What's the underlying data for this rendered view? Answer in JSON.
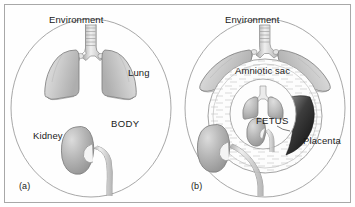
{
  "figure": {
    "type": "anatomical-diagram",
    "panels": [
      {
        "id": "a",
        "caption": "(a)",
        "labels": {
          "environment": "Environment",
          "lung": "Lung",
          "body": "BODY",
          "kidney": "Kidney"
        },
        "organs": [
          "trachea",
          "lungs",
          "kidney",
          "ureter"
        ],
        "description": "Adult body circle with lungs open to environment and kidney"
      },
      {
        "id": "b",
        "caption": "(b)",
        "labels": {
          "environment": "Environment",
          "amniotic_sac": "Amniotic sac",
          "fetus": "FETUS",
          "placenta": "Placenta"
        },
        "organs": [
          "maternal-trachea",
          "maternal-lungs",
          "maternal-kidney",
          "maternal-ureter",
          "amniotic-fluid",
          "fetal-lungs",
          "fetal-kidney",
          "placenta",
          "umbilical-cord"
        ],
        "description": "Pregnant body circle containing amniotic sac and fetus with placenta"
      }
    ]
  },
  "colors": {
    "frame_border": "#a8a8a8",
    "background": "#fefefe",
    "outline": "#8a8a8a",
    "organ_fill_light": "#d8d8d8",
    "organ_fill_mid": "#bdbdbd",
    "organ_fill_dark": "#9a9a9a",
    "placenta_dark": "#2a2a2a",
    "text": "#1a1a1a",
    "fluid_hatch": "#c4c4c4"
  }
}
